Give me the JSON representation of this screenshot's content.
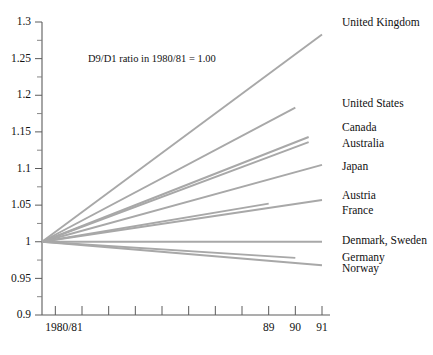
{
  "chart_data": {
    "type": "line",
    "title": "",
    "subtitle": "",
    "annotation": "D9/D1 ratio in 1980/81 = 1.00",
    "xlabel": "",
    "ylabel": "",
    "xlim": [
      1980.5,
      1991
    ],
    "ylim": [
      0.9,
      1.3
    ],
    "grid": false,
    "legend_position": "right-inline-labels",
    "x_base_label": "1980/81",
    "x_tick_values": [
      1981,
      1982,
      1983,
      1984,
      1985,
      1986,
      1987,
      1988,
      1989,
      1990,
      1991
    ],
    "x_tick_labels": [
      "",
      "",
      "",
      "",
      "",
      "",
      "",
      "",
      "89",
      "90",
      "91"
    ],
    "y_tick_values": [
      0.9,
      0.95,
      1,
      1.05,
      1.1,
      1.15,
      1.2,
      1.25,
      1.3
    ],
    "y_tick_labels": [
      "0.9",
      "0.95",
      "1",
      "1.05",
      "1.1",
      "1.15",
      "1.2",
      "1.25",
      "1.3"
    ],
    "y_minor_tick_values": [
      0.925,
      0.975,
      1.025,
      1.075,
      1.125,
      1.175,
      1.225,
      1.275
    ],
    "series": [
      {
        "name": "United Kingdom",
        "label": "United Kingdom",
        "x_start": 1980.5,
        "x_end": 1991,
        "y_start": 1.0,
        "y_end": 1.283,
        "label_y": 1.298
      },
      {
        "name": "United States",
        "label": "United States",
        "x_start": 1980.5,
        "x_end": 1990,
        "y_start": 1.0,
        "y_end": 1.183,
        "label_y": 1.188
      },
      {
        "name": "Canada",
        "label": "Canada",
        "x_start": 1980.5,
        "x_end": 1990.5,
        "y_start": 1.0,
        "y_end": 1.143,
        "label_y": 1.155
      },
      {
        "name": "Australia",
        "label": "Australia",
        "x_start": 1980.5,
        "x_end": 1990.5,
        "y_start": 1.0,
        "y_end": 1.136,
        "label_y": 1.133
      },
      {
        "name": "Japan",
        "label": "Japan",
        "x_start": 1980.5,
        "x_end": 1991,
        "y_start": 1.0,
        "y_end": 1.105,
        "label_y": 1.102
      },
      {
        "name": "Austria",
        "label": "Austria",
        "x_start": 1980.5,
        "x_end": 1989,
        "y_start": 1.0,
        "y_end": 1.052,
        "label_y": 1.062
      },
      {
        "name": "France",
        "label": "France",
        "x_start": 1980.5,
        "x_end": 1991,
        "y_start": 1.0,
        "y_end": 1.057,
        "label_y": 1.042
      },
      {
        "name": "Denmark, Sweden",
        "label": "Denmark, Sweden",
        "x_start": 1980.5,
        "x_end": 1991,
        "y_start": 1.0,
        "y_end": 1.0,
        "label_y": 1.0
      },
      {
        "name": "Germany",
        "label": "Germany",
        "x_start": 1980.5,
        "x_end": 1990,
        "y_start": 1.0,
        "y_end": 0.978,
        "label_y": 0.977
      },
      {
        "name": "Norway",
        "label": "Norway",
        "x_start": 1980.5,
        "x_end": 1991,
        "y_start": 1.0,
        "y_end": 0.968,
        "label_y": 0.962
      }
    ]
  },
  "colors": {
    "line": "#a8a8a8",
    "axis": "#5c5c5c",
    "text": "#111111",
    "background": "#ffffff"
  }
}
